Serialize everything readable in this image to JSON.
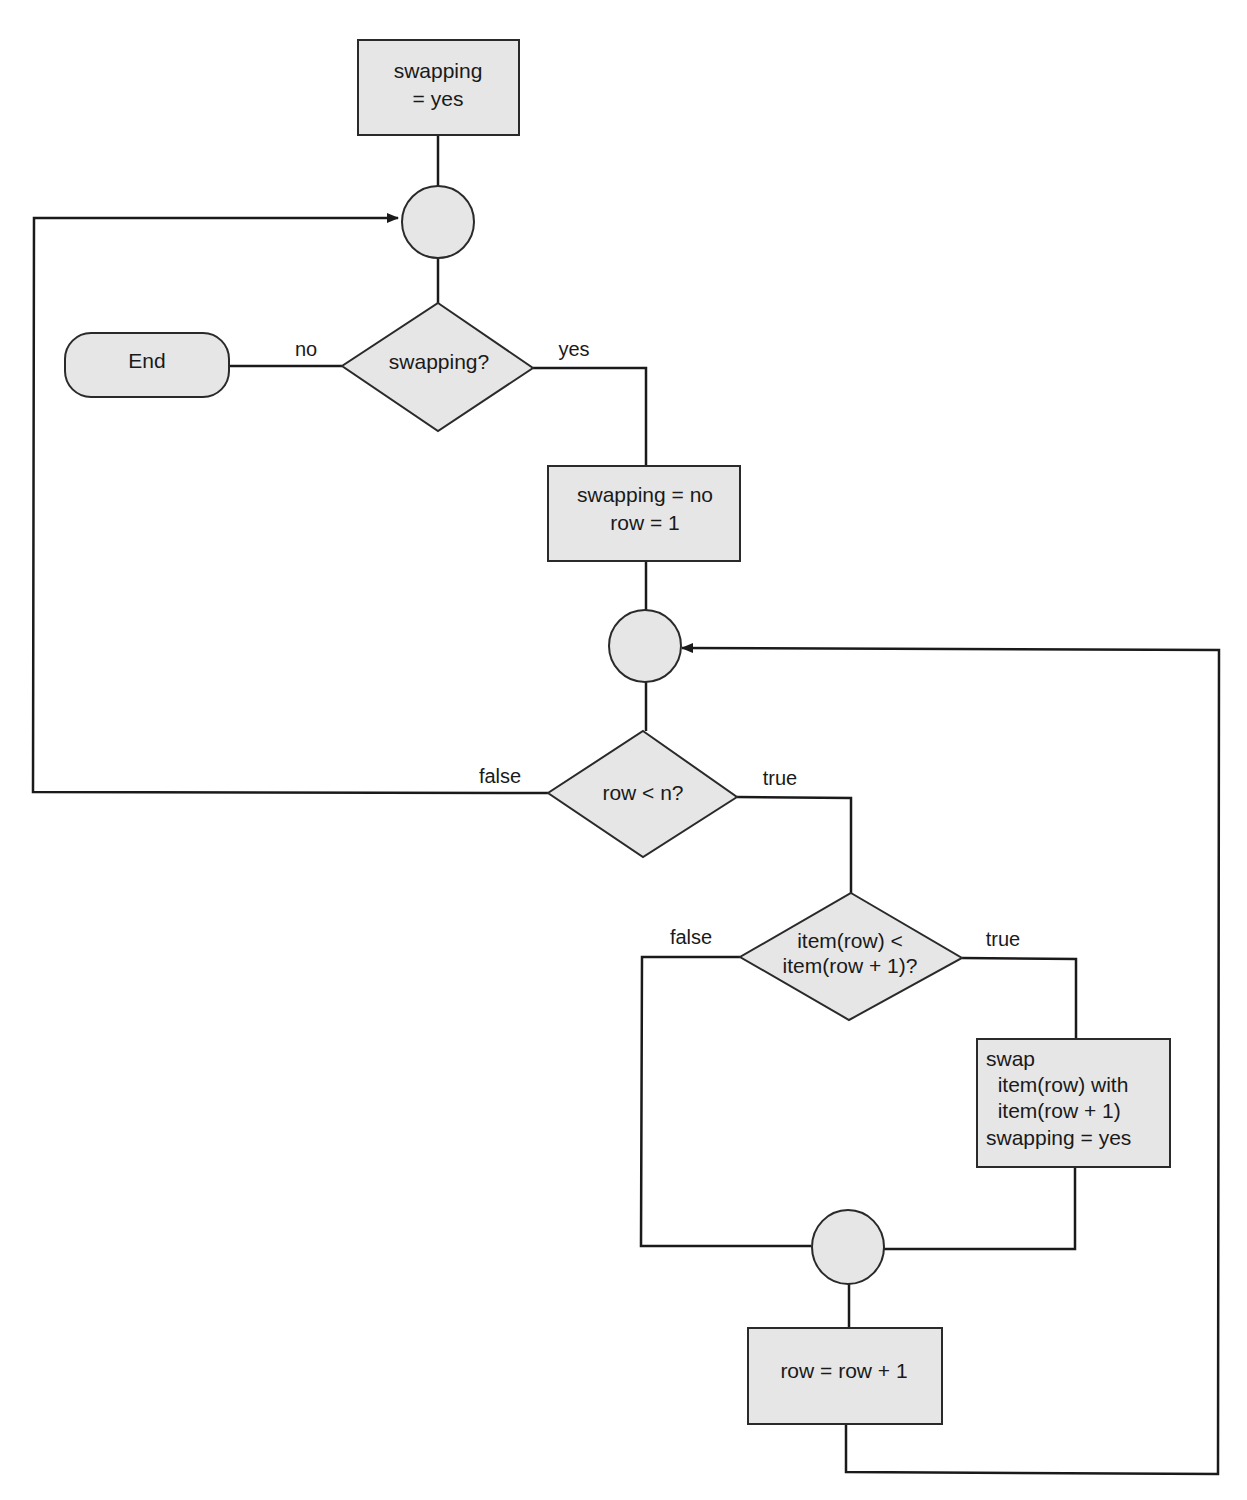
{
  "diagram": {
    "type": "flowchart",
    "nodes": {
      "init": {
        "kind": "process",
        "lines": [
          "swapping",
          "= yes"
        ]
      },
      "junction1": {
        "kind": "connector"
      },
      "decision_swapping": {
        "kind": "decision",
        "lines": [
          "swapping?"
        ]
      },
      "end": {
        "kind": "terminator",
        "lines": [
          "End"
        ]
      },
      "reset": {
        "kind": "process",
        "lines": [
          "swapping = no",
          "row = 1"
        ]
      },
      "junction2": {
        "kind": "connector"
      },
      "decision_row": {
        "kind": "decision",
        "lines": [
          "row < n?"
        ]
      },
      "decision_compare": {
        "kind": "decision",
        "lines": [
          "item(row) <",
          "item(row + 1)?"
        ]
      },
      "swap": {
        "kind": "process",
        "lines": [
          "swap",
          "  item(row) with",
          "  item(row + 1)",
          "swapping = yes"
        ]
      },
      "junction3": {
        "kind": "connector"
      },
      "increment": {
        "kind": "process",
        "lines": [
          "row = row + 1"
        ]
      }
    },
    "edges": [
      {
        "from": "init",
        "to": "junction1",
        "label": ""
      },
      {
        "from": "junction1",
        "to": "decision_swapping",
        "label": ""
      },
      {
        "from": "decision_swapping",
        "to": "end",
        "label": "no"
      },
      {
        "from": "decision_swapping",
        "to": "reset",
        "label": "yes"
      },
      {
        "from": "reset",
        "to": "junction2",
        "label": ""
      },
      {
        "from": "junction2",
        "to": "decision_row",
        "label": ""
      },
      {
        "from": "decision_row",
        "to": "junction1",
        "label": "false"
      },
      {
        "from": "decision_row",
        "to": "decision_compare",
        "label": "true"
      },
      {
        "from": "decision_compare",
        "to": "junction3",
        "label": "false"
      },
      {
        "from": "decision_compare",
        "to": "swap",
        "label": "true"
      },
      {
        "from": "swap",
        "to": "junction3",
        "label": ""
      },
      {
        "from": "junction3",
        "to": "increment",
        "label": ""
      },
      {
        "from": "increment",
        "to": "junction2",
        "label": ""
      }
    ],
    "edge_labels": {
      "no": "no",
      "yes": "yes",
      "row_false": "false",
      "row_true": "true",
      "cmp_false": "false",
      "cmp_true": "true"
    }
  },
  "colors": {
    "shape_fill": "#e6e6e6",
    "stroke": "#1a1a1a",
    "background": "#ffffff"
  }
}
